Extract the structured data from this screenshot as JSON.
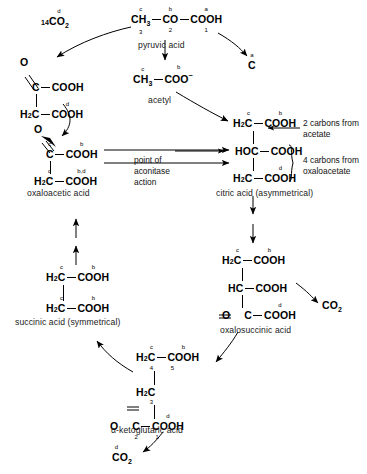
{
  "diagram": {
    "ink_color": "#000000",
    "background": "#ffffff"
  },
  "molecules": {
    "pyruvic": {
      "name": "pyruvic acid",
      "g1": "CH",
      "g1_n": "3",
      "g1_sup": "c",
      "g1_sub": "3",
      "g2": "CO",
      "g2_sup": "b",
      "g2_sub": "2",
      "g3": "COOH",
      "g3_sup": "a",
      "g3_sub": "1"
    },
    "co2_left": {
      "prefix": "14",
      "body": "CO",
      "sub": "2",
      "sup": "d"
    },
    "carbon_a": {
      "body": "C",
      "sup": "a"
    },
    "acetyl": {
      "name": "acetyl",
      "g1": "CH",
      "g1_n": "3",
      "g1_sup": "c",
      "g2": "COO",
      "g2_sup": "b",
      "g2_charge": "−"
    },
    "oxaloacetic_top": {
      "o_label": "O",
      "r1_c": "C",
      "r1_right": "COOH",
      "r2_left": "H",
      "r2_left_n": "2",
      "r2_c": "C",
      "r2_right": "COOH",
      "r2_right_sup": "d"
    },
    "oxaloacetic": {
      "name": "oxaloacetic acid",
      "o_label": "O",
      "r1_c": "C",
      "r1_c_sup": "c",
      "r1_right": "COOH",
      "r1_right_sup": "b",
      "r2_left": "H",
      "r2_left_n": "2",
      "r2_c": "C",
      "r2_c_sup": "c",
      "r2_right": "COOH",
      "r2_right_sup": "b,d"
    },
    "citric": {
      "name": "citric acid (asymmetrical)",
      "r1_left": "H",
      "r1_left_n": "2",
      "r1_c": "C",
      "r1_c_sup": "c",
      "r1_right": "COOH",
      "r1_right_sup": "b",
      "r2_left": "HOC",
      "r2_right": "COOH",
      "r3_left": "H",
      "r3_left_n": "2",
      "r3_c": "C",
      "r3_right": "COOH",
      "r3_right_sup": "d"
    },
    "oxalosuccinic": {
      "name": "oxalosuccinic acid",
      "r1_left": "H",
      "r1_left_n": "2",
      "r1_c": "C",
      "r1_c_sup": "c",
      "r1_right": "COOH",
      "r1_right_sup": "b",
      "r2_left": "HC",
      "r2_right": "COOH",
      "r3_o": "O",
      "r3_c": "C",
      "r3_right": "COOH",
      "r3_right_sup": "d"
    },
    "succinic": {
      "name": "succinic acid (symmetrical)",
      "r1_left": "H",
      "r1_left_n": "2",
      "r1_c": "C",
      "r1_c_sup": "c",
      "r1_right": "COOH",
      "r1_right_sup": "b",
      "r2_left": "H",
      "r2_left_n": "2",
      "r2_c": "C",
      "r2_c_sup": "c",
      "r2_right": "COOH",
      "r2_right_sup": "b"
    },
    "ketoglutaric": {
      "name": "α-ketoglutaric acid",
      "r1_left": "H",
      "r1_left_n": "2",
      "r1_c": "C",
      "r1_c_sup": "c",
      "r1_c_sub": "4",
      "r1_right": "COOH",
      "r1_right_sup": "b",
      "r1_right_sub": "5",
      "r2_left": "H",
      "r2_left_n": "2",
      "r2_c": "C",
      "r2_c_sub": "3",
      "r3_o": "O",
      "r3_c": "C",
      "r3_c_sub": "2",
      "r3_right": "COOH",
      "r3_right_sup": "d",
      "r3_right_sub": "1"
    },
    "co2_right": {
      "body": "CO",
      "sub": "2"
    },
    "co2_bottom": {
      "body": "CO",
      "sub": "2",
      "sup": "d"
    }
  },
  "annotations": {
    "acetate_note_line1": "2 carbons from",
    "acetate_note_line2": "acetate",
    "oxaloacetate_note_line1": "4 carbons from",
    "oxaloacetate_note_line2": "oxaloacetate",
    "aconitase_line1": "point of",
    "aconitase_line2": "aconitase",
    "aconitase_line3": "action"
  }
}
